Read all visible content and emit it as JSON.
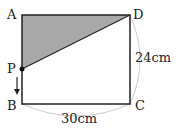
{
  "diagram": {
    "type": "geometry-rectangle",
    "points": {
      "A": "A",
      "B": "B",
      "C": "C",
      "D": "D",
      "P": "P"
    },
    "dimensions": {
      "width_label": "30cm",
      "height_label": "24cm"
    },
    "shaded_region": "triangle APD",
    "moving_point": "P moves from A toward B",
    "colors": {
      "shade": "#a8a8a8",
      "line": "#222222",
      "arc": "#cccccc"
    }
  }
}
